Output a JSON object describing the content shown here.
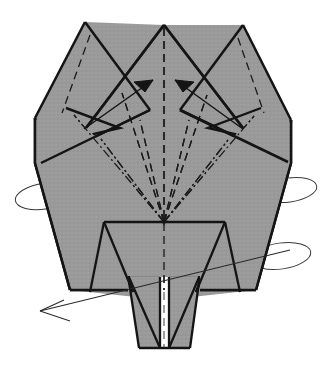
{
  "figure": {
    "kind": "origami-folding-diagram",
    "canvas": {
      "width": 329,
      "height": 376
    },
    "background_color": "#ffffff"
  },
  "palette": {
    "paper_gray": "#9a9a9a",
    "paper_gray_shadow": "#939393",
    "outline_black": "#141414",
    "fold_line": "#1b1b1b",
    "arc_line": "#3a3a3a",
    "white_gap": "#ffffff"
  },
  "stroke_widths": {
    "outline": 2.6,
    "inner_edge": 2.2,
    "fold": 1.25,
    "arrow": 1.4,
    "arc": 1.0
  },
  "shapes": {
    "left_horn": {
      "name": "left-horn",
      "points": "85,22 150,110 41,163 35,118"
    },
    "right_horn": {
      "name": "right-horn",
      "points": "243,25 180,110 288,162 291,120"
    },
    "center_peak": {
      "name": "center-peak",
      "points": "164,25 86,128 164,225 243,128"
    },
    "body_main": {
      "name": "body-main-plate",
      "points": "35,118 41,163 35,163 70,290 256,290 291,163 291,120 243,128 164,225 86,128"
    },
    "body_silhouette": {
      "name": "body-silhouette",
      "points": "85,22 164,25 243,25 291,120 291,163 256,290 164,300 70,290 35,163 35,118"
    },
    "inner_trapezoid": {
      "name": "inner-trapezoid-plate",
      "points": "104,222 225,222 240,292 90,292"
    },
    "left_inner_triangle": {
      "name": "left-inner-triangle",
      "points": "104,222 104,292 133,292"
    },
    "right_inner_triangle": {
      "name": "right-inner-triangle",
      "points": "225,222 225,292 196,292"
    },
    "leg_left": {
      "name": "leg-left-flap",
      "points": "128,275 163,275 163,348 139,348"
    },
    "leg_right": {
      "name": "leg-right-flap",
      "points": "200,275 166,275 166,348 190,348"
    },
    "foot_plate": {
      "name": "foot-plate",
      "points": "128,275 200,275 190,348 139,348"
    },
    "foot_tri_left": {
      "name": "foot-triangle-left",
      "points": "128,275 160,275 139,348"
    },
    "foot_tri_right": {
      "name": "foot-triangle-right",
      "points": "200,275 169,275 190,348"
    },
    "center_gap_strip": {
      "name": "center-white-gap-strip",
      "points": "160,277 169,277 169,348 160,348"
    }
  },
  "edges": [
    {
      "name": "outline-left-horn-left",
      "d": "M 85 22 L 35 118"
    },
    {
      "name": "outline-left-horn-crease",
      "d": "M 85 22 L 150 110"
    },
    {
      "name": "outline-left-horn-lower",
      "d": "M 35 118 L 41 163"
    },
    {
      "name": "outline-center-left",
      "d": "M 164 25 L 86 128"
    },
    {
      "name": "outline-center-right",
      "d": "M 164 25 L 243 128"
    },
    {
      "name": "outline-right-horn-right",
      "d": "M 243 25 L 291 120"
    },
    {
      "name": "outline-right-horn-crease",
      "d": "M 243 25 L 180 110"
    },
    {
      "name": "outline-right-horn-lower",
      "d": "M 291 120 L 288 162"
    },
    {
      "name": "outline-body-left",
      "d": "M 35 118 L 35 163 L 70 290"
    },
    {
      "name": "outline-body-right",
      "d": "M 291 120 L 291 163 L 256 290"
    },
    {
      "name": "outline-body-bottom-left",
      "d": "M 70 290 L 128 290"
    },
    {
      "name": "outline-body-bottom-right",
      "d": "M 256 290 L 200 290"
    },
    {
      "name": "edge-horn-left-fold",
      "d": "M 41 163 L 150 110"
    },
    {
      "name": "edge-horn-right-fold",
      "d": "M 288 162 L 180 110"
    },
    {
      "name": "edge-trapezoid-top",
      "d": "M 104 222 L 225 222"
    },
    {
      "name": "edge-trapezoid-left",
      "d": "M 104 222 L 90 292"
    },
    {
      "name": "edge-trapezoid-right",
      "d": "M 225 222 L 240 292"
    },
    {
      "name": "edge-inner-tri-left",
      "d": "M 104 222 L 133 292"
    },
    {
      "name": "edge-inner-tri-right",
      "d": "M 225 222 L 196 292"
    },
    {
      "name": "edge-leg-left-outer",
      "d": "M 128 275 L 139 348"
    },
    {
      "name": "edge-leg-right-outer",
      "d": "M 200 275 L 190 348"
    },
    {
      "name": "edge-foot-bottom",
      "d": "M 139 348 L 190 348"
    },
    {
      "name": "edge-foot-tri-left",
      "d": "M 128 275 L 160 348"
    },
    {
      "name": "edge-foot-tri-right",
      "d": "M 200 275 L 169 348"
    },
    {
      "name": "edge-foot-top-left",
      "d": "M 128 275 L 160 275"
    },
    {
      "name": "edge-foot-top-right",
      "d": "M 200 275 L 169 275"
    },
    {
      "name": "edge-gap-left",
      "d": "M 160 277 L 160 348"
    },
    {
      "name": "edge-gap-right",
      "d": "M 169 277 L 169 348"
    }
  ],
  "zigzags": [
    {
      "name": "zigzag-notch-left",
      "d": "M 66 108 L 120 128 L 72 139"
    },
    {
      "name": "zigzag-notch-right",
      "d": "M 261 108 L 208 128 L 256 139"
    }
  ],
  "folds_valley": [
    {
      "name": "valley-center-axis",
      "d": "M 164 28 L 164 290"
    },
    {
      "name": "valley-leg-axis",
      "d": "M 164 292 L 164 348"
    },
    {
      "name": "valley-left-horn-crease",
      "d": "M 90 35 L 62 113"
    },
    {
      "name": "valley-right-horn-crease",
      "d": "M 238 38 L 264 113"
    },
    {
      "name": "valley-fan-left",
      "d": "M 164 222 L 122 93"
    },
    {
      "name": "valley-fan-right",
      "d": "M 164 222 L 207 95"
    },
    {
      "name": "valley-fan-left-inner",
      "d": "M 164 222 L 140 120"
    },
    {
      "name": "valley-fan-right-inner",
      "d": "M 164 222 L 189 120"
    }
  ],
  "folds_mountain": [
    {
      "name": "mountain-fan-left-outer",
      "d": "M 164 222 L 74 115"
    },
    {
      "name": "mountain-fan-right-outer",
      "d": "M 164 222 L 254 116"
    },
    {
      "name": "mountain-fan-left-mid",
      "d": "M 164 222 L 101 139"
    },
    {
      "name": "mountain-fan-right-mid",
      "d": "M 164 222 L 228 140"
    }
  ],
  "arrows": [
    {
      "name": "fold-arrow-left",
      "kind": "solid-head-pointing-up-right",
      "shaft": "M 84 129 L 153 80",
      "head": "M 153 80 L 134 82 L 145 92 Z"
    },
    {
      "name": "fold-arrow-right",
      "kind": "solid-head-pointing-up-left",
      "shaft": "M 243 129 L 175 80",
      "head": "M 175 80 L 194 82 L 183 92 Z"
    },
    {
      "name": "rotate-arrow-bottom-left",
      "kind": "open-head-pointing-down-left",
      "shaft": "M 290 250 L 40 311",
      "head": "M 40 311 L 64 300 M 40 311 L 70 321"
    }
  ],
  "rotation_arcs": [
    {
      "name": "rotate-arc-left",
      "cx": 45,
      "cy": 196,
      "rx": 30,
      "ry": 13,
      "rotation": -9,
      "sweep_start": 200,
      "sweep_end": 20
    },
    {
      "name": "rotate-arc-right-upper",
      "cx": 289,
      "cy": 190,
      "rx": 28,
      "ry": 12,
      "rotation": -8
    },
    {
      "name": "rotate-arc-right-lower",
      "cx": 281,
      "cy": 256,
      "rx": 30,
      "ry": 13,
      "rotation": -8
    }
  ],
  "legend": {
    "valley_fold": "dashed line",
    "mountain_fold": "dash-dot line",
    "cut_or_edge": "solid line",
    "motion": "arrow",
    "rotate": "elliptical arc"
  }
}
